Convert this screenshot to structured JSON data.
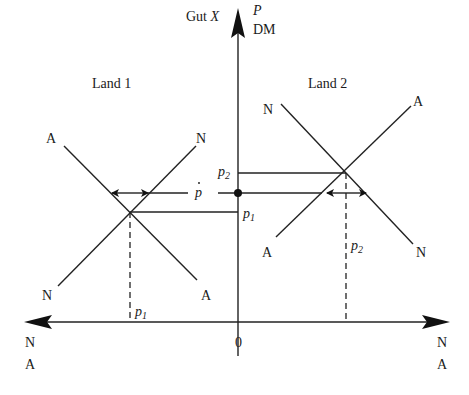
{
  "diagram": {
    "y_axis": {
      "label_left": "Gut X",
      "label_left_plain": "Gut ",
      "label_left_italic": "X",
      "label_right_top": "P",
      "label_right_bottom": "DM"
    },
    "x_axis": {
      "left_end": {
        "top": "N",
        "bottom": "A"
      },
      "right_end": {
        "top": "N",
        "bottom": "A"
      },
      "origin": "0"
    },
    "land1": {
      "title": "Land 1",
      "curve_A_top": "A",
      "curve_N_top": "N",
      "curve_N_bottom": "N",
      "curve_A_bottom": "A",
      "price_axis_label": "p",
      "price_axis_sub": "1",
      "price_xaxis_label": "p",
      "price_xaxis_sub": "1"
    },
    "land2": {
      "title": "Land 2",
      "curve_N_top": "N",
      "curve_A_top": "A",
      "curve_A_bottom": "A",
      "curve_N_bottom": "N",
      "price_axis_label": "p",
      "price_axis_sub": "2",
      "price_dashed_label": "p",
      "price_dashed_sub": "2"
    },
    "world_price": {
      "label": "p",
      "accent": "̇"
    },
    "colors": {
      "line": "#222222",
      "background": "#ffffff"
    }
  }
}
